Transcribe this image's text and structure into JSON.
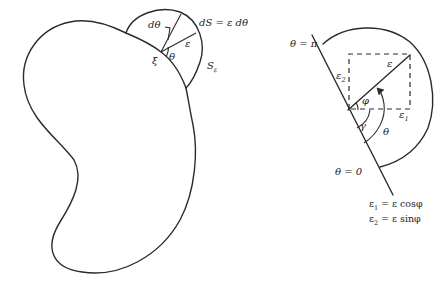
{
  "left_figure": {
    "labels": {
      "dtheta": "dθ",
      "ds_eq": "dS = ε dθ",
      "epsilon": "ε",
      "theta": "θ",
      "xi": "ξ",
      "s_eps": "S",
      "s_eps_sub": "ε"
    }
  },
  "right_figure": {
    "labels": {
      "theta_pi": "θ = π",
      "theta_zero": "θ = 0",
      "epsilon": "ε",
      "eps2": "ε",
      "eps2_sub": "2",
      "eps1": "ε",
      "eps1_sub": "1",
      "phi": "φ",
      "gamma": "γ",
      "theta": "θ"
    },
    "equations": {
      "eq1_lhs": "ε",
      "eq1_sub": "1",
      "eq1_rhs": " = ε cosφ",
      "eq2_lhs": "ε",
      "eq2_sub": "2",
      "eq2_rhs": " = ε sinφ"
    }
  },
  "colors": {
    "stroke": "#2b2b2b",
    "background": "#ffffff"
  }
}
